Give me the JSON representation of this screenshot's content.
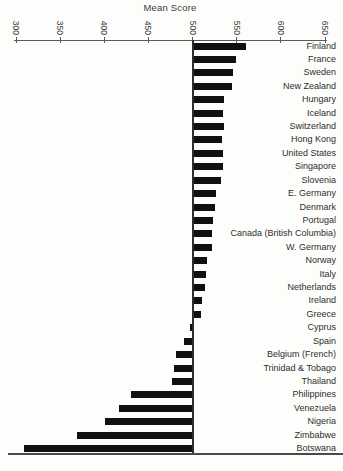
{
  "chart_data": {
    "type": "bar",
    "orientation": "horizontal",
    "title": "Mean Score",
    "baseline_value": 500,
    "axis": {
      "position": "top",
      "min": 300,
      "max": 650,
      "ticks": [
        300,
        350,
        400,
        450,
        500,
        550,
        600,
        650
      ],
      "tick_label_rotation": "vertical"
    },
    "legend": "none",
    "grid": "off",
    "categories": [
      "Finland",
      "France",
      "Sweden",
      "New Zealand",
      "Hungary",
      "Iceland",
      "Switzerland",
      "Hong Kong",
      "United States",
      "Singapore",
      "Slovenia",
      "E. Germany",
      "Denmark",
      "Portugal",
      "Canada (British Columbia)",
      "W. Germany",
      "Norway",
      "Italy",
      "Netherlands",
      "Ireland",
      "Greece",
      "Cyprus",
      "Spain",
      "Belgium (French)",
      "Trinidad & Tobago",
      "Thailand",
      "Philippines",
      "Venezuela",
      "Nigeria",
      "Zimbabwe",
      "Botswana"
    ],
    "values": [
      560,
      549,
      546,
      545,
      536,
      535,
      536,
      533,
      535,
      534,
      532,
      526,
      525,
      523,
      522,
      522,
      516,
      515,
      514,
      511,
      509,
      497,
      490,
      481,
      479,
      477,
      430,
      417,
      401,
      369,
      309
    ],
    "bar_origin_note": "bars extend left or right from the 500 reference line"
  },
  "colors": {
    "background": "#fdfdfb",
    "bar": "#101010",
    "axis_line": "#5a5a5a",
    "reference_line": "#2e2e2e",
    "bottom_rule": "#4a4a4a",
    "text": "#2e2e2e"
  }
}
